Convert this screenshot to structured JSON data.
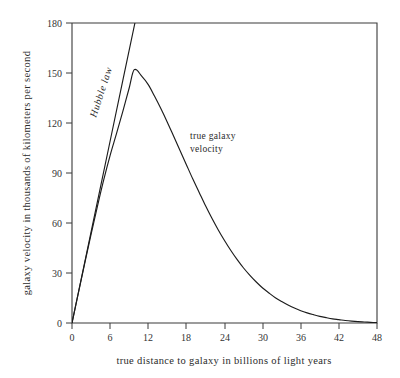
{
  "chart_data": {
    "type": "line",
    "title": "",
    "xlabel": "true distance to galaxy in billions of light years",
    "ylabel": "galaxy velocity in thousands of kilometers per second",
    "xlim": [
      0,
      48
    ],
    "ylim": [
      0,
      180
    ],
    "xticks": [
      0,
      6,
      12,
      18,
      24,
      30,
      36,
      42,
      48
    ],
    "yticks": [
      0,
      30,
      60,
      90,
      120,
      150,
      180
    ],
    "xtick_labels": [
      "0",
      "6",
      "12",
      "18",
      "24",
      "30",
      "36",
      "42",
      "48"
    ],
    "ytick_labels": [
      "0",
      "30",
      "60",
      "90",
      "120",
      "150",
      "180"
    ],
    "grid": false,
    "legend_position": "inline-annotations",
    "line_color": "#1c1c1c",
    "background_color": "#ffffff",
    "series": [
      {
        "name": "Hubble law",
        "annotation": "Hubble law",
        "style": "straight-line",
        "x": [
          0,
          2,
          4,
          6,
          8,
          9.9
        ],
        "values": [
          0,
          36.4,
          72.8,
          109.2,
          145.6,
          180
        ]
      },
      {
        "name": "true galaxy velocity",
        "annotation": "true galaxy velocity",
        "style": "curve",
        "peak_x": 9.8,
        "peak_y": 152,
        "x": [
          0,
          1,
          2,
          3,
          4,
          5,
          6,
          7,
          8,
          9,
          9.8,
          11,
          12,
          13,
          14,
          15,
          16,
          17,
          18,
          19,
          20,
          21,
          22,
          23,
          24,
          25,
          26,
          27,
          28,
          29,
          30,
          31,
          32,
          33,
          34,
          35,
          36,
          37,
          38,
          39,
          40,
          41,
          42,
          43,
          44,
          45,
          46,
          47,
          48
        ],
        "values": [
          0,
          18.0,
          35.8,
          53.2,
          70.0,
          86.0,
          100.6,
          113.6,
          127.0,
          141.0,
          152.0,
          148.0,
          143.0,
          136.0,
          128.5,
          120.5,
          112.0,
          103.5,
          95.0,
          86.5,
          78.5,
          70.5,
          63.0,
          56.0,
          49.5,
          43.5,
          38.0,
          33.0,
          28.6,
          24.6,
          21.0,
          18.0,
          15.2,
          12.9,
          10.8,
          9.0,
          7.4,
          6.1,
          5.0,
          4.0,
          3.2,
          2.5,
          2.0,
          1.5,
          1.1,
          0.8,
          0.6,
          0.4,
          0.2
        ]
      }
    ],
    "annotations": [
      {
        "text": "Hubble law",
        "rotated": true,
        "rotation_deg": -72
      },
      {
        "text": "true galaxy",
        "rotated": false
      },
      {
        "text": "velocity",
        "rotated": false
      }
    ]
  },
  "annotation_labels": {
    "hubble": "Hubble law",
    "true_velocity_line1": "true galaxy",
    "true_velocity_line2": "velocity"
  }
}
